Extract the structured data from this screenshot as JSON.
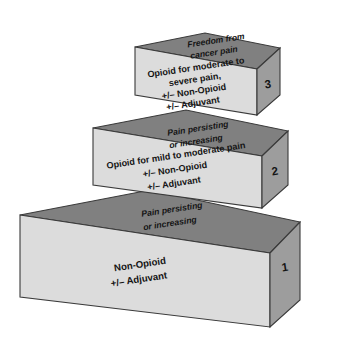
{
  "diagram": {
    "colors": {
      "top_face": "#808080",
      "front_face": "#dcdcdc",
      "side_face": "#9d9d9d",
      "outline": "#3a3a3a",
      "text": "#141414",
      "background": "#ffffff"
    },
    "steps": [
      {
        "number": "1",
        "top_label_lines": [
          "Pain persisting",
          "or increasing"
        ],
        "front_label_lines": [
          "Non-Opioid",
          "+/– Adjuvant"
        ]
      },
      {
        "number": "2",
        "top_label_lines": [
          "Pain persisting",
          "or increasing"
        ],
        "front_label_lines": [
          "Opioid for mild to moderate pain",
          "+/– Non-Opioid",
          "+/– Adjuvant"
        ]
      },
      {
        "number": "3",
        "top_label_lines": [
          "Freedom from",
          "cancer pain"
        ],
        "front_label_lines": [
          "Opioid for moderate to",
          "severe pain,",
          "+/– Non-Opioid",
          "+/– Adjuvant"
        ]
      }
    ]
  }
}
